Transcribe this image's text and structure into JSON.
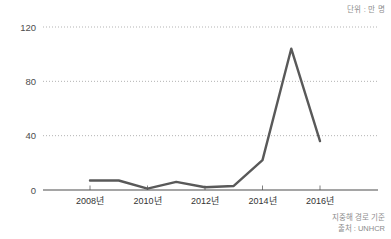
{
  "unit_note": "단위 : 만 명",
  "footnotes": [
    "지중해 경로 기준",
    "출처 : UNHCR"
  ],
  "colors": {
    "line": "#595959",
    "gridline": "#b3b3b3",
    "axis": "#4d4d4d",
    "tick_text": "#333333",
    "note_text": "#8c8c8c",
    "background": "#ffffff"
  },
  "chart_data": {
    "type": "line",
    "title": "",
    "subtitle": "",
    "xlabel": "",
    "ylabel": "",
    "unit": "만 명",
    "x": [
      2008,
      2009,
      2010,
      2011,
      2012,
      2013,
      2014,
      2015,
      2016
    ],
    "values": [
      7,
      7,
      1,
      6,
      2,
      3,
      22,
      104,
      36
    ],
    "series": [
      {
        "name": "지중해 경로 난민 유입",
        "values": [
          7,
          7,
          1,
          6,
          2,
          3,
          22,
          104,
          36
        ]
      }
    ],
    "xlim": [
      2008,
      2016
    ],
    "ylim": [
      0,
      120
    ],
    "ytick_labels": [
      "0",
      "40",
      "80",
      "120"
    ],
    "ytick_values": [
      0,
      40,
      80,
      120
    ],
    "xtick_labels": [
      "2008년",
      "2010년",
      "2012년",
      "2014년",
      "2016년"
    ],
    "xtick_values": [
      2008,
      2010,
      2012,
      2014,
      2016
    ],
    "grid": true,
    "grid_axis": "y",
    "grid_style": "dotted",
    "legend": false,
    "legend_position": "none",
    "annotations": [
      "단위 : 만 명",
      "지중해 경로 기준",
      "출처 : UNHCR"
    ]
  }
}
